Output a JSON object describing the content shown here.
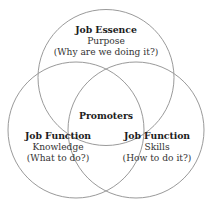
{
  "diagram": {
    "type": "venn-3-circle",
    "background_color": "#ffffff",
    "stroke_color": "#9a9a9a",
    "text_color": "#2b2b2b",
    "center": {
      "label": "Promoters"
    },
    "circles": [
      {
        "id": "job-essence",
        "position": "top",
        "title": "Job Essence",
        "subtitle": "Purpose",
        "question": "(Why are we doing it?)"
      },
      {
        "id": "job-function-knowledge",
        "position": "bottom-left",
        "title": "Job Function",
        "subtitle": "Knowledge",
        "question": "(What to do?)"
      },
      {
        "id": "job-function-skills",
        "position": "bottom-right",
        "title": "Job Function",
        "subtitle": "Skills",
        "question": "(How to do it?)"
      }
    ]
  }
}
